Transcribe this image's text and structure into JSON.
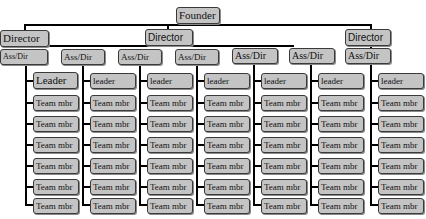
{
  "chart": {
    "founder": "Founder",
    "directors": [
      "Director",
      "Director",
      "Director"
    ],
    "columns": [
      {
        "assdir": "Ass/Dir",
        "assdir_display": "Ass/Dir",
        "leader": "Leader",
        "members": [
          "Team mbr",
          "Team mbr",
          "Team mbr",
          "Team mbr",
          "Team mbr",
          "Team mbr"
        ]
      },
      {
        "assdir": "Ass/Dir",
        "leader": "leader",
        "members": [
          "Team mbr",
          "Team mbr",
          "Team mbr",
          "Team mbr",
          "Team mbr",
          "Team mbr"
        ]
      },
      {
        "assdir": "Ass/Dir",
        "leader": "leader",
        "members": [
          "Team mbr",
          "Team mbr",
          "Team mbr",
          "Team mbr",
          "Team mbr",
          "Team mbr"
        ]
      },
      {
        "assdir": "Ass/Dir",
        "leader": "leader",
        "members": [
          "Team mbr",
          "Team mbr",
          "Team mbr",
          "Team mbr",
          "Team mbr",
          "Team mbr"
        ]
      },
      {
        "assdir": "Ass/Dir",
        "leader": "leader",
        "members": [
          "Team mbr",
          "Team mbr",
          "Team mbr",
          "Team mbr",
          "Team mbr",
          "Team mbr"
        ]
      },
      {
        "assdir": "Ass/Dir",
        "leader": "leader",
        "members": [
          "Team mbr",
          "Team mbr",
          "Team mbr",
          "Team mbr",
          "Team mbr",
          "Team mbr"
        ]
      },
      {
        "assdir": "Ass/Dir",
        "leader": "leader",
        "members": [
          "Team mbr",
          "Team mbr",
          "Team mbr",
          "Team mbr",
          "Team mbr",
          "Team mbr"
        ]
      }
    ],
    "colors": {
      "box_fill": "#c4c4c4",
      "box_border": "#3a3a3a",
      "connector": "#000000"
    }
  }
}
